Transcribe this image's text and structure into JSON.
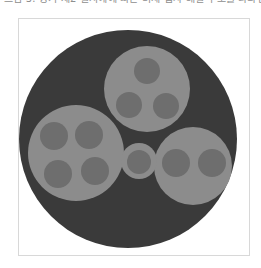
{
  "caption": {
    "text": "그림 3. 상기 제2 실시예에 따른 미세 입자 배열 구조를 나타낸 단면도이다."
  },
  "figure": {
    "title": "",
    "background_color": "#ffffff",
    "frame_border_color": "#d8d8d8",
    "outer_circle_color": "#3a3a3a",
    "cluster_circle_color": "#8c8c8c",
    "dot_color": "#6e6e6e",
    "outer_circle": {
      "name": "outer-disc",
      "cx": 109,
      "cy": 120,
      "r": 109
    },
    "clusters": [
      {
        "name": "cluster-top",
        "cx": 128,
        "cy": 70,
        "r": 43,
        "dot_count": 3,
        "dots": [
          {
            "cx": 128,
            "cy": 52,
            "r": 13
          },
          {
            "cx": 110,
            "cy": 86,
            "r": 13
          },
          {
            "cx": 147,
            "cy": 87,
            "r": 13
          }
        ]
      },
      {
        "name": "cluster-left",
        "cx": 57,
        "cy": 134,
        "r": 48,
        "dot_count": 4,
        "dots": [
          {
            "cx": 35,
            "cy": 117,
            "r": 14
          },
          {
            "cx": 70,
            "cy": 116,
            "r": 14
          },
          {
            "cx": 39,
            "cy": 155,
            "r": 14
          },
          {
            "cx": 76,
            "cy": 152,
            "r": 14
          }
        ]
      },
      {
        "name": "cluster-right",
        "cx": 174,
        "cy": 147,
        "r": 39,
        "dot_count": 2,
        "dots": [
          {
            "cx": 157,
            "cy": 144,
            "r": 14
          },
          {
            "cx": 193,
            "cy": 144,
            "r": 14
          }
        ]
      },
      {
        "name": "cluster-center",
        "cx": 120,
        "cy": 142,
        "r": 18,
        "dot_count": 1,
        "dots": [
          {
            "cx": 120,
            "cy": 143,
            "r": 12
          }
        ]
      }
    ]
  }
}
